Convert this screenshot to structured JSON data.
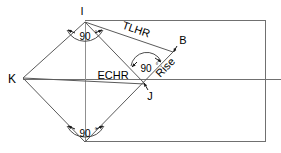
{
  "diagram": {
    "type": "geometric-construction",
    "background_color": "#ffffff",
    "line_color": "#4d4d4d",
    "text_color": "#000000",
    "point_labels": {
      "i": "I",
      "b": "B",
      "j": "J",
      "k": "K"
    },
    "segment_labels": {
      "tlhr": "TLHR",
      "echr": "ECHR",
      "rise": "Rise"
    },
    "angle_labels": {
      "top": "90",
      "middle": "90",
      "bottom": "90"
    },
    "angle_degree_symbol": "°",
    "geometry": {
      "rect": {
        "x": 85,
        "y": 20,
        "width": 181,
        "height": 122
      },
      "vertices": {
        "I": [
          85,
          22
        ],
        "K": [
          23,
          78
        ],
        "S": [
          85,
          142
        ],
        "E": [
          147,
          83
        ],
        "B": [
          173,
          52
        ],
        "J": [
          143,
          82
        ]
      },
      "horizontal_line_y": 80
    }
  }
}
